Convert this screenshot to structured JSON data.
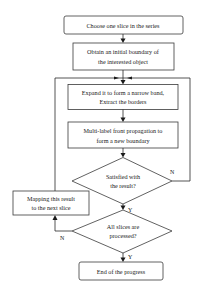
{
  "diagram": {
    "type": "flowchart",
    "nodes": {
      "choose": {
        "lines": [
          "Choose one slice in the series"
        ]
      },
      "obtain": {
        "lines": [
          "Obtain an initial boundary of",
          "the interested object"
        ]
      },
      "expand": {
        "lines": [
          "Expand it to form a narrow band,",
          "Extract the borders"
        ]
      },
      "propagate": {
        "lines": [
          "Multi-label front propagation to",
          "form a new boundary"
        ]
      },
      "satisfied": {
        "lines": [
          "Satisfied with",
          "the result?"
        ]
      },
      "mapping": {
        "lines": [
          "Mapping this result",
          "to the next slice"
        ]
      },
      "all_processed": {
        "lines": [
          "All slices are",
          "processed?"
        ]
      },
      "end": {
        "lines": [
          "End of the progress"
        ]
      }
    },
    "edge_labels": {
      "satisfied_no": "N",
      "satisfied_yes": "Y",
      "all_no": "N",
      "all_yes": "Y"
    },
    "colors": {
      "stroke": "#3a3a3a",
      "text": "#1a1a1a",
      "background": "#ffffff"
    }
  }
}
